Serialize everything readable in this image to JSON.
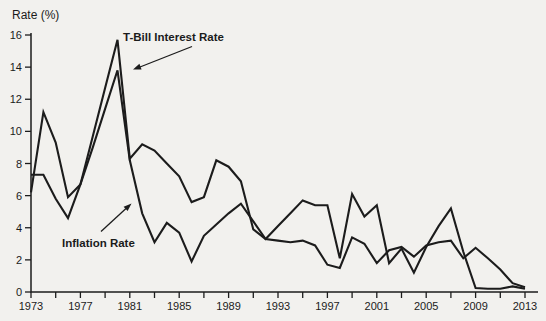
{
  "page": {
    "background": "#f2f1ee",
    "ink_color": "#1c1c1c"
  },
  "chart_data": {
    "type": "line",
    "title": "",
    "xlabel": "",
    "ylabel": "Rate (%)",
    "ylim": [
      0,
      16
    ],
    "xlim": [
      1973,
      2013
    ],
    "grid": false,
    "legend_position": "inline-annotations",
    "yticks": [
      0,
      2,
      4,
      6,
      8,
      10,
      12,
      14,
      16
    ],
    "xtick_labels": [
      1973,
      1977,
      1981,
      1985,
      1989,
      1993,
      1997,
      2001,
      2005,
      2009,
      2013
    ],
    "xtick_minor_step": 2,
    "line_color": "#1c1c1c",
    "x": [
      1973,
      1974,
      1975,
      1976,
      1977,
      1978,
      1979,
      1980,
      1981,
      1982,
      1983,
      1984,
      1985,
      1986,
      1987,
      1988,
      1989,
      1990,
      1991,
      1992,
      1993,
      1994,
      1995,
      1996,
      1997,
      1998,
      1999,
      2000,
      2001,
      2002,
      2003,
      2004,
      2005,
      2006,
      2007,
      2008,
      2009,
      2010,
      2011,
      2012,
      2013
    ],
    "series": [
      {
        "name": "T-Bill Interest Rate",
        "values": [
          7.3,
          7.3,
          5.8,
          4.6,
          6.7,
          9.7,
          12.7,
          15.7,
          8.3,
          9.2,
          8.8,
          8.0,
          7.2,
          5.6,
          5.9,
          8.2,
          7.8,
          6.9,
          3.9,
          3.3,
          4.1,
          4.9,
          5.7,
          5.4,
          5.4,
          2.1,
          6.1,
          4.7,
          5.4,
          1.8,
          2.7,
          1.2,
          2.8,
          4.1,
          5.2,
          2.5,
          0.25,
          0.2,
          0.2,
          0.35,
          0.2
        ]
      },
      {
        "name": "Inflation Rate",
        "values": [
          6.2,
          11.2,
          9.3,
          5.9,
          6.7,
          9.0,
          11.4,
          13.8,
          8.2,
          4.9,
          3.1,
          4.3,
          3.7,
          1.9,
          3.5,
          4.2,
          4.9,
          5.5,
          4.4,
          3.3,
          3.2,
          3.1,
          3.2,
          2.9,
          1.7,
          1.5,
          3.4,
          3.0,
          1.8,
          2.6,
          2.8,
          2.2,
          2.9,
          3.1,
          3.2,
          2.1,
          2.75,
          2.1,
          1.4,
          0.55,
          0.3
        ]
      }
    ],
    "annotations": [
      {
        "text": "T-Bill Interest Rate",
        "series_index": 0
      },
      {
        "text": "Inflation Rate",
        "series_index": 1
      }
    ]
  }
}
